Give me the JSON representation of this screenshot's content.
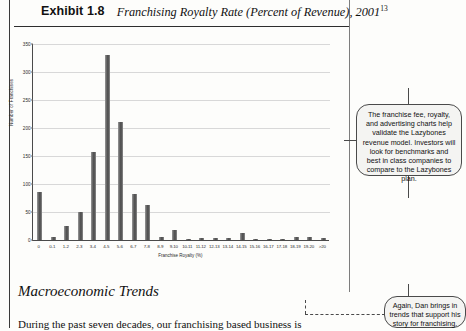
{
  "exhibit": {
    "number": "Exhibit 1.8",
    "title": "Franchising Royalty Rate (Percent of Revenue), 2001",
    "footnote": "13"
  },
  "chart_data": {
    "type": "bar",
    "title": "Franchising Royalty Rate (Percent of Revenue), 2001",
    "xlabel": "Franchise Royalty (%)",
    "ylabel": "Number of Franchises",
    "ylim": [
      0,
      350
    ],
    "yticks": [
      0,
      50,
      100,
      150,
      200,
      250,
      300,
      350
    ],
    "grid": true,
    "legend": "none",
    "categories": [
      "0",
      "0-1",
      "1-2",
      "2-3",
      "3-4",
      "4-5",
      "5-6",
      "6-7",
      "7-8",
      "8-9",
      "9-10",
      "10-11",
      "11-12",
      "12-13",
      "13-14",
      "14-15",
      "15-16",
      "16-17",
      "17-18",
      "18-19",
      "19-20",
      ">20"
    ],
    "values": [
      85,
      5,
      25,
      50,
      158,
      330,
      210,
      83,
      62,
      5,
      18,
      2,
      3,
      3,
      3,
      12,
      2,
      2,
      2,
      6,
      6,
      3
    ]
  },
  "callouts": [
    {
      "id": "franchise-fee-note",
      "text": "The franchise fee, royalty, and advertising charts help validate the Lazybones revenue model. Investors will look for benchmarks and best in class companies to compare to the Lazybones plan."
    },
    {
      "id": "macro-trends-note",
      "text": "Again, Dan brings in trends that support his story for franchising."
    }
  ],
  "section": {
    "heading": "Macroeconomic Trends",
    "body": "During the past seven decades, our franchising based business is"
  }
}
